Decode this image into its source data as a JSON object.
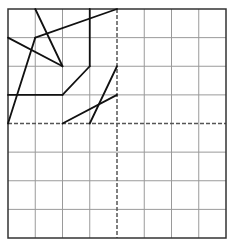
{
  "diagram": {
    "type": "grid-figure",
    "grid": {
      "columns": 8,
      "rows": 8,
      "origin_px": [
        8,
        9
      ],
      "size_px": [
        218,
        229
      ],
      "grid_line_color": "#9a9a9a",
      "border_color": "#333333",
      "axis_color": "#555555",
      "figure_color": "#111111"
    },
    "axes": {
      "vertical_dashed_col": 4,
      "horizontal_dashed_row": 4
    },
    "segments": [
      {
        "from": [
          1,
          0
        ],
        "to": [
          2,
          2
        ]
      },
      {
        "from": [
          0,
          1
        ],
        "to": [
          2,
          2
        ]
      },
      {
        "from": [
          1,
          1
        ],
        "to": [
          4,
          0
        ]
      },
      {
        "from": [
          1,
          1
        ],
        "to": [
          0,
          4
        ]
      },
      {
        "from": [
          3,
          0
        ],
        "to": [
          3,
          2
        ]
      },
      {
        "from": [
          3,
          2
        ],
        "to": [
          2,
          3
        ]
      },
      {
        "from": [
          2,
          3
        ],
        "to": [
          0,
          3
        ]
      },
      {
        "from": [
          4,
          2
        ],
        "to": [
          3,
          4
        ]
      },
      {
        "from": [
          4,
          3
        ],
        "to": [
          2,
          4
        ]
      }
    ]
  }
}
